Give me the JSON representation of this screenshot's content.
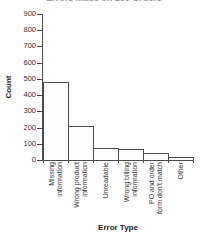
{
  "figure": {
    "background": "#fefefe",
    "axis_color": "#4a4a4a",
    "text_color": "#333333",
    "bar_fill": "#fdfdfd",
    "bar_border": "#4a4a4a",
    "title_remnant_color": "#9a9a9a"
  },
  "chart_data": {
    "type": "bar",
    "title": "Errors Made on 100 Orders",
    "title_note": "title is clipped at the top edge of the screenshot; only the bottom sliver of the gray text is visible",
    "categories": [
      "Missing information",
      "Wrong product information",
      "Unreadable",
      "Wrong billing information",
      "PO and order form don't match",
      "Other"
    ],
    "category_label_lines": [
      [
        "Missing",
        "information"
      ],
      [
        "Wrong product",
        "information"
      ],
      [
        "Unreadable"
      ],
      [
        "Wrong billing",
        "information"
      ],
      [
        "PO and order",
        "form don't match"
      ],
      [
        "Other"
      ]
    ],
    "values": [
      480,
      210,
      75,
      70,
      45,
      20
    ],
    "xlabel": "Error Type",
    "ylabel": "Count",
    "ylim": [
      0,
      900
    ],
    "yticks": [
      0,
      100,
      200,
      300,
      400,
      500,
      600,
      700,
      800,
      900
    ],
    "grid": false,
    "legend": "none",
    "bar_style": {
      "fill": "white",
      "edge": "dark gray",
      "gap": 0
    }
  }
}
